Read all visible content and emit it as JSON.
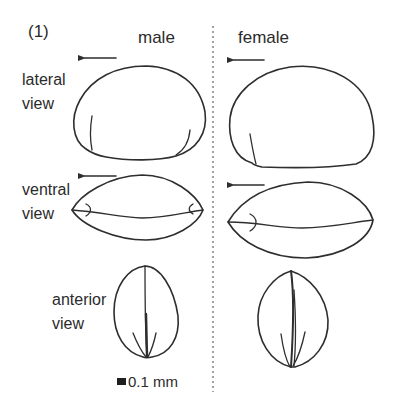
{
  "figure": {
    "panel_label": "(1)",
    "columns": [
      {
        "id": "male",
        "label": "male"
      },
      {
        "id": "female",
        "label": "female"
      }
    ],
    "rows": [
      {
        "id": "lateral",
        "label_line1": "lateral",
        "label_line2": "view"
      },
      {
        "id": "ventral",
        "label_line1": "ventral",
        "label_line2": "view"
      },
      {
        "id": "anterior",
        "label_line1": "anterior",
        "label_line2": "view"
      }
    ],
    "arrow_direction": "left",
    "scale_bar": {
      "label": "0.1 mm"
    },
    "colors": {
      "ink": "#2e2e2e",
      "divider": "#7a7a7a",
      "background": "#ffffff"
    }
  }
}
